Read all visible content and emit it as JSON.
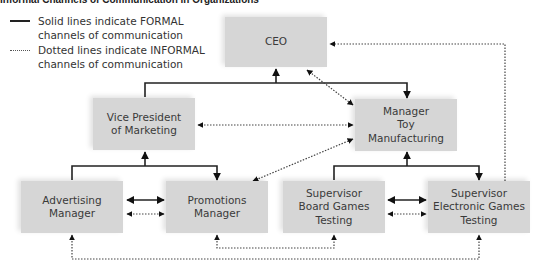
{
  "title": "Informal Channels of Communication in Organizations",
  "legend": {
    "formal": {
      "line1": "Solid lines indicate FORMAL",
      "line2": "channels of communication",
      "style": "solid"
    },
    "informal": {
      "line1": "Dotted lines indicate INFORMAL",
      "line2": "channels of communication",
      "style": "dotted"
    }
  },
  "colors": {
    "box_fill": "#d6d6d6",
    "line": "#222222",
    "text": "#3a3a3a"
  },
  "nodes": {
    "ceo": {
      "lines": [
        "CEO"
      ]
    },
    "vp_marketing": {
      "lines": [
        "Vice President",
        "of Marketing"
      ]
    },
    "manager_toy": {
      "lines": [
        "Manager",
        "Toy",
        "Manufacturing"
      ]
    },
    "advertising": {
      "lines": [
        "Advertising",
        "Manager"
      ]
    },
    "promotions": {
      "lines": [
        "Promotions",
        "Manager"
      ]
    },
    "board_games": {
      "lines": [
        "Supervisor",
        "Board Games",
        "Testing"
      ]
    },
    "electronic_games": {
      "lines": [
        "Supervisor",
        "Electronic Games",
        "Testing"
      ]
    }
  },
  "edges": {
    "formal": [
      {
        "from": "vp_marketing",
        "to": "ceo"
      },
      {
        "from": "manager_toy",
        "to": "ceo"
      },
      {
        "from": "advertising",
        "to": "vp_marketing"
      },
      {
        "from": "promotions",
        "to": "vp_marketing"
      },
      {
        "from": "board_games",
        "to": "manager_toy"
      },
      {
        "from": "electronic_games",
        "to": "manager_toy"
      },
      {
        "from": "advertising",
        "to": "promotions"
      },
      {
        "from": "board_games",
        "to": "electronic_games"
      }
    ],
    "informal": [
      {
        "from": "ceo",
        "to": "manager_toy"
      },
      {
        "from": "vp_marketing",
        "to": "manager_toy"
      },
      {
        "from": "promotions",
        "to": "manager_toy"
      },
      {
        "from": "electronic_games",
        "to": "ceo"
      },
      {
        "from": "advertising",
        "to": "promotions"
      },
      {
        "from": "board_games",
        "to": "electronic_games"
      },
      {
        "from": "promotions",
        "to": "board_games"
      },
      {
        "from": "advertising",
        "to": "electronic_games"
      }
    ]
  }
}
